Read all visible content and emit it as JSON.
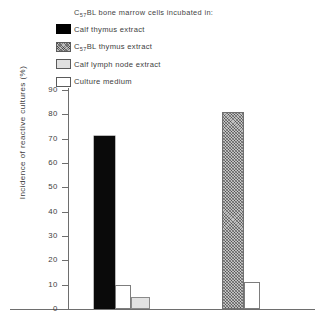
{
  "legend": {
    "title_html": "C<sub>57</sub>BL bone marrow cells incubated in:",
    "title_text": "C57BL bone marrow cells incubated in:",
    "items": [
      {
        "label_html": "Calf thymus extract",
        "label_text": "Calf thymus extract",
        "swatch": "solid-black",
        "color": "#000000"
      },
      {
        "label_html": "C<sub>57</sub>BL thymus extract",
        "label_text": "C57BL thymus extract",
        "swatch": "hatched-gray",
        "color": "#bdbdbd"
      },
      {
        "label_html": "Calf lymph node extract",
        "label_text": "Calf lymph node extract",
        "swatch": "light-gray",
        "color": "#e0e0e0"
      },
      {
        "label_html": "Culture medium",
        "label_text": "Culture medium",
        "swatch": "white",
        "color": "#ffffff"
      }
    ]
  },
  "axis": {
    "y_title": "Incidence of reactive cultures (%)",
    "y_ticks": [
      0,
      10,
      20,
      30,
      40,
      50,
      60,
      70,
      80,
      90
    ],
    "y_min": 0,
    "y_max": 90
  },
  "chart_data": {
    "type": "bar",
    "title": "",
    "xlabel": "",
    "ylabel": "Incidence of reactive cultures (%)",
    "ylim": [
      0,
      90
    ],
    "grid": false,
    "legend_position": "top-left",
    "legend_title": "C57BL bone marrow cells incubated in:",
    "categories": [
      "Calf thymus extract",
      "Culture medium",
      "Calf lymph node extract",
      "C57BL thymus extract",
      "Culture medium"
    ],
    "values": [
      71,
      10,
      5,
      81,
      11
    ],
    "bars": [
      {
        "label": "Calf thymus extract",
        "value": 71,
        "fill": "solid-black",
        "group": 1,
        "x_px": 94,
        "width_px": 21
      },
      {
        "label": "Culture medium",
        "value": 10,
        "fill": "white",
        "group": 1,
        "x_px": 115,
        "width_px": 16
      },
      {
        "label": "Calf lymph node extract",
        "value": 5,
        "fill": "light-gray",
        "group": 1,
        "x_px": 131,
        "width_px": 19
      },
      {
        "label": "C57BL thymus extract",
        "value": 81,
        "fill": "hatched-gray",
        "group": 2,
        "x_px": 222,
        "width_px": 22
      },
      {
        "label": "Culture medium",
        "value": 11,
        "fill": "white",
        "group": 2,
        "x_px": 244,
        "width_px": 16
      }
    ]
  }
}
